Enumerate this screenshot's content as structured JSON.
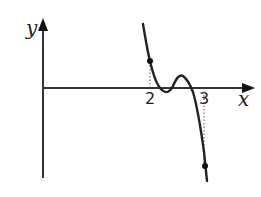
{
  "diagram": {
    "type": "function-graph",
    "axes": {
      "x_label": "x",
      "y_label": "y"
    },
    "ticks": [
      {
        "label": "2",
        "x_value": 2
      },
      {
        "label": "3",
        "x_value": 3
      }
    ],
    "marked_points": [
      {
        "x_value": 2,
        "description": "point on curve above x=2 (f(2) > 0)"
      },
      {
        "x_value": 3,
        "description": "point on curve below x=3 (f(3) < 0)"
      }
    ],
    "curve": {
      "description": "decreasing curve that dips just below the x-axis after x=2, rises to a local max above the axis, then falls steeply below the axis before x=3",
      "color": "#222222"
    },
    "colors": {
      "axis": "#333333",
      "curve": "#222222",
      "guide_lines": "#555555"
    }
  }
}
